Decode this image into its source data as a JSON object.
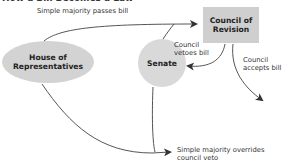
{
  "title": "How a Bill Becomes a Law",
  "nodes": {
    "house": {
      "label_line1": "House of",
      "label_line2": "Representatives",
      "fill": "#d3d3d3"
    },
    "senate": {
      "label": "Senate",
      "fill": "#d9d9d9"
    },
    "council": {
      "label_line1": "Council of",
      "label_line2": "Revision",
      "fill": "#cfcfcf"
    }
  },
  "edges": {
    "passes": "Simple majority passes bill",
    "vetoes_line1": "Council",
    "vetoes_line2": "vetoes bill",
    "accepts_line1": "Council",
    "accepts_line2": "accepts bill",
    "overrides_line1": "Simple majority overrides",
    "overrides_line2": "council veto"
  },
  "colors": {
    "line": "#555555",
    "arrow": "#333333"
  }
}
